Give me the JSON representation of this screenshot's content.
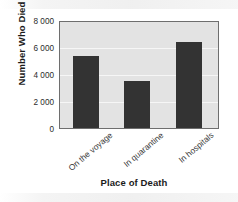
{
  "chart_data": {
    "type": "bar",
    "title": "",
    "xlabel": "Place of Death",
    "ylabel": "Number Who Died",
    "categories": [
      "On the voyage",
      "In quarantine",
      "In hospitals"
    ],
    "values": [
      5400,
      3550,
      6500
    ],
    "ylim": [
      0,
      8000
    ],
    "yticks": [
      0,
      2000,
      4000,
      6000,
      8000
    ],
    "ytick_labels": [
      "0",
      "2 000",
      "4 000",
      "6 000",
      "8 000"
    ],
    "grid": "horizontal",
    "legend": "none",
    "bar_color": "#333333",
    "plot_background": "#e3e3e3",
    "gridline_color": "#f6f6f6",
    "axis_border_color": "#6e6e6e"
  }
}
